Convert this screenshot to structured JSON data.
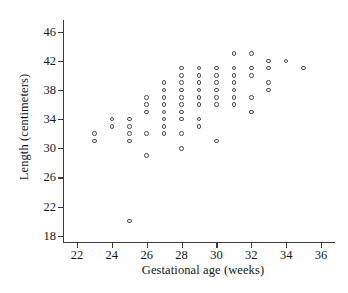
{
  "chart_data": {
    "type": "scatter",
    "title": "",
    "xlabel": "Gestational age (weeks)",
    "ylabel": "Length (centimeters)",
    "xlim": [
      21.2,
      36.8
    ],
    "ylim": [
      17.0,
      47.6
    ],
    "xticks": [
      22,
      24,
      26,
      28,
      30,
      32,
      34,
      36
    ],
    "yticks": [
      18,
      22,
      26,
      30,
      34,
      38,
      42,
      46
    ],
    "xtick_labels": [
      "22",
      "24",
      "26",
      "28",
      "30",
      "32",
      "34",
      "36"
    ],
    "ytick_labels": [
      "18",
      "22",
      "26",
      "30",
      "34",
      "38",
      "42",
      "46"
    ],
    "grid": false,
    "legend": null,
    "marker": "open-circle",
    "marker_color": "#4a4a4f",
    "points": [
      {
        "x": 23,
        "y": 31
      },
      {
        "x": 23,
        "y": 32
      },
      {
        "x": 24,
        "y": 33
      },
      {
        "x": 24,
        "y": 34
      },
      {
        "x": 25,
        "y": 20
      },
      {
        "x": 25,
        "y": 31
      },
      {
        "x": 25,
        "y": 32
      },
      {
        "x": 25,
        "y": 33
      },
      {
        "x": 25,
        "y": 34
      },
      {
        "x": 26,
        "y": 29
      },
      {
        "x": 26,
        "y": 32
      },
      {
        "x": 26,
        "y": 35
      },
      {
        "x": 26,
        "y": 36
      },
      {
        "x": 26,
        "y": 37
      },
      {
        "x": 27,
        "y": 32
      },
      {
        "x": 27,
        "y": 33
      },
      {
        "x": 27,
        "y": 34
      },
      {
        "x": 27,
        "y": 35
      },
      {
        "x": 27,
        "y": 36
      },
      {
        "x": 27,
        "y": 37
      },
      {
        "x": 27,
        "y": 38
      },
      {
        "x": 27,
        "y": 39
      },
      {
        "x": 28,
        "y": 30
      },
      {
        "x": 28,
        "y": 32
      },
      {
        "x": 28,
        "y": 34
      },
      {
        "x": 28,
        "y": 35
      },
      {
        "x": 28,
        "y": 36
      },
      {
        "x": 28,
        "y": 37
      },
      {
        "x": 28,
        "y": 38
      },
      {
        "x": 28,
        "y": 39
      },
      {
        "x": 28,
        "y": 40
      },
      {
        "x": 28,
        "y": 41
      },
      {
        "x": 29,
        "y": 33
      },
      {
        "x": 29,
        "y": 34
      },
      {
        "x": 29,
        "y": 36
      },
      {
        "x": 29,
        "y": 37
      },
      {
        "x": 29,
        "y": 38
      },
      {
        "x": 29,
        "y": 39
      },
      {
        "x": 29,
        "y": 40
      },
      {
        "x": 29,
        "y": 41
      },
      {
        "x": 30,
        "y": 31
      },
      {
        "x": 30,
        "y": 36
      },
      {
        "x": 30,
        "y": 37
      },
      {
        "x": 30,
        "y": 38
      },
      {
        "x": 30,
        "y": 39
      },
      {
        "x": 30,
        "y": 40
      },
      {
        "x": 30,
        "y": 41
      },
      {
        "x": 31,
        "y": 36
      },
      {
        "x": 31,
        "y": 37
      },
      {
        "x": 31,
        "y": 38
      },
      {
        "x": 31,
        "y": 39
      },
      {
        "x": 31,
        "y": 40
      },
      {
        "x": 31,
        "y": 41
      },
      {
        "x": 31,
        "y": 43
      },
      {
        "x": 32,
        "y": 35
      },
      {
        "x": 32,
        "y": 37
      },
      {
        "x": 32,
        "y": 40
      },
      {
        "x": 32,
        "y": 41
      },
      {
        "x": 32,
        "y": 43
      },
      {
        "x": 33,
        "y": 38
      },
      {
        "x": 33,
        "y": 39
      },
      {
        "x": 33,
        "y": 41
      },
      {
        "x": 33,
        "y": 42
      },
      {
        "x": 34,
        "y": 42
      },
      {
        "x": 35,
        "y": 41
      }
    ]
  }
}
